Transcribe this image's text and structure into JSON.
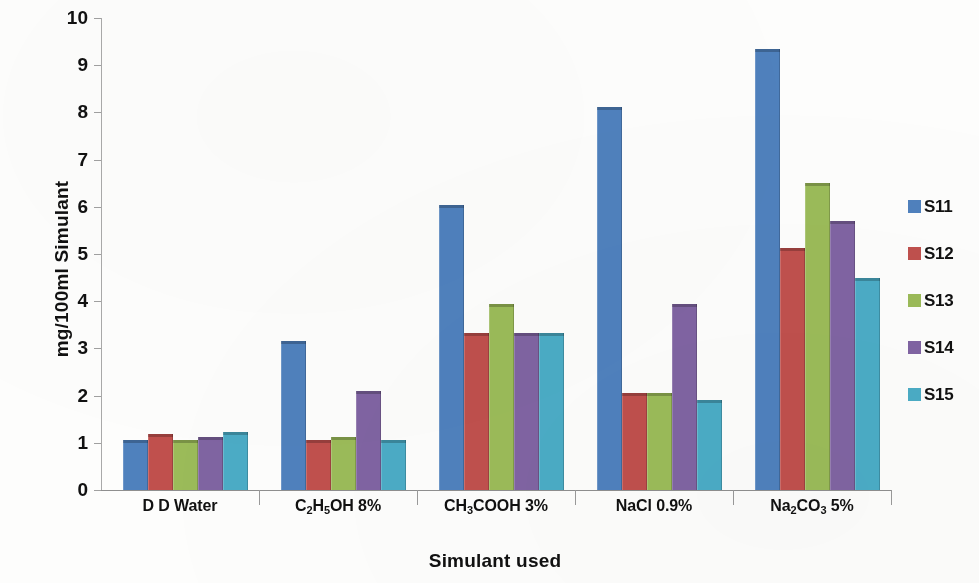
{
  "chart_data": {
    "type": "bar",
    "title": "",
    "xlabel": "Simulant used",
    "ylabel": "mg/100ml Simulant",
    "ylim": [
      0,
      10
    ],
    "ytick_labels": [
      "10",
      "9",
      "8",
      "7",
      "6",
      "5",
      "4",
      "3",
      "2",
      "1",
      "0"
    ],
    "ytick_values": [
      10,
      9,
      8,
      7,
      6,
      5,
      4,
      3,
      2,
      1,
      0
    ],
    "grid": false,
    "legend_position": "right",
    "categories": [
      "D D Water",
      "C2H5OH 8%",
      "CH3COOH 3%",
      "NaCl 0.9%",
      "Na2CO3 5%"
    ],
    "category_labels_html": [
      "D D Water",
      "C<sub>2</sub>H<sub>5</sub>OH 8%",
      "CH<sub>3</sub>COOH 3%",
      "NaCl 0.9%",
      "Na<sub>2</sub>CO<sub>3</sub> 5%"
    ],
    "series": [
      {
        "name": "S11",
        "color": "#4F81BD",
        "values": [
          1.07,
          3.15,
          6.03,
          8.12,
          9.35
        ]
      },
      {
        "name": "S12",
        "color": "#C0504D",
        "values": [
          1.18,
          1.07,
          3.33,
          2.05,
          5.12
        ]
      },
      {
        "name": "S13",
        "color": "#9BBB59",
        "values": [
          1.07,
          1.13,
          3.95,
          2.05,
          6.5
        ]
      },
      {
        "name": "S14",
        "color": "#8064A2",
        "values": [
          1.13,
          2.1,
          3.33,
          3.95,
          5.7
        ]
      },
      {
        "name": "S15",
        "color": "#4BACC6",
        "values": [
          1.23,
          1.05,
          3.33,
          1.9,
          4.5
        ]
      }
    ]
  },
  "legend": {
    "items": [
      {
        "label": "S11",
        "color": "#4F81BD"
      },
      {
        "label": "S12",
        "color": "#C0504D"
      },
      {
        "label": "S13",
        "color": "#9BBB59"
      },
      {
        "label": "S14",
        "color": "#8064A2"
      },
      {
        "label": "S15",
        "color": "#4BACC6"
      }
    ]
  }
}
